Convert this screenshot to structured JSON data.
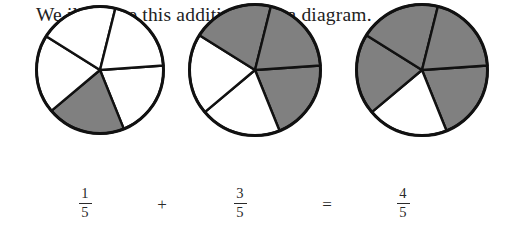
{
  "caption": "We illustrate this addition with a diagram.",
  "colors": {
    "shaded": "#808080",
    "unshaded": "#ffffff",
    "outline": "#111111",
    "text": "#222222",
    "background": "#ffffff"
  },
  "diagram": {
    "denominator": 5,
    "circles": [
      {
        "label": "first-addend-circle",
        "cx": 100,
        "cy": 115,
        "r": 65,
        "sectors": 5,
        "shaded_count": 1,
        "rotation_deg": -4,
        "shaded_indices": [
          1
        ],
        "fraction": {
          "numerator": "1",
          "denominator": "5"
        }
      },
      {
        "label": "second-addend-circle",
        "cx": 255,
        "cy": 115,
        "r": 67,
        "sectors": 5,
        "shaded_count": 3,
        "rotation_deg": -4,
        "shaded_indices": [
          3,
          4,
          0
        ],
        "fraction": {
          "numerator": "3",
          "denominator": "5"
        }
      },
      {
        "label": "sum-circle",
        "cx": 422,
        "cy": 115,
        "r": 67,
        "sectors": 5,
        "shaded_count": 4,
        "rotation_deg": -4,
        "shaded_indices": [
          0,
          2,
          3,
          4
        ],
        "fraction": {
          "numerator": "4",
          "denominator": "5"
        }
      }
    ]
  },
  "equation": {
    "terms": [
      {
        "name": "first-fraction",
        "numerator": "1",
        "denominator": "5",
        "x": 85
      },
      {
        "name": "second-fraction",
        "numerator": "3",
        "denominator": "5",
        "x": 240
      },
      {
        "name": "result-fraction",
        "numerator": "4",
        "denominator": "5",
        "x": 403
      }
    ],
    "operators": [
      {
        "name": "plus-operator",
        "symbol": "+",
        "x": 162
      },
      {
        "name": "equals-operator",
        "symbol": "=",
        "x": 327
      }
    ]
  }
}
